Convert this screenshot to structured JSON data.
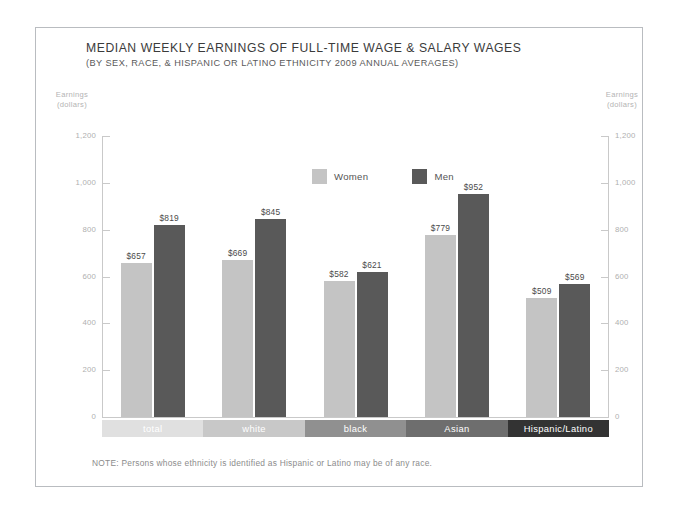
{
  "header": {
    "title": "MEDIAN WEEKLY EARNINGS OF FULL-TIME WAGE & SALARY WAGES",
    "subtitle": "(BY SEX, RACE, & HISPANIC OR LATINO ETHNICITY 2009 ANNUAL AVERAGES)"
  },
  "axis_caption": {
    "line1": "Earnings",
    "line2": "(dollars)"
  },
  "note": "NOTE: Persons whose ethnicity is identified as Hispanic or Latino may be of any race.",
  "colors": {
    "women": "#c4c4c4",
    "men": "#595959",
    "axis": "#c9c9c9",
    "tick_label": "#b0b0b0",
    "frame_border": "#b9bcc0",
    "background": "#ffffff",
    "category_total": "#e0e0e0",
    "category_white": "#c8c8c8",
    "category_black": "#909090",
    "category_asian": "#6e6e6e",
    "category_hispanic": "#333333"
  },
  "chart_data": {
    "type": "bar",
    "title": "MEDIAN WEEKLY EARNINGS OF FULL-TIME WAGE & SALARY WAGES",
    "subtitle": "(BY SEX, RACE, & HISPANIC OR LATINO ETHNICITY 2009 ANNUAL AVERAGES)",
    "xlabel": "",
    "ylabel": "Earnings (dollars)",
    "ylim": [
      0,
      1200
    ],
    "yticks": [
      0,
      200,
      400,
      600,
      800,
      1000,
      1200
    ],
    "ytick_labels": [
      "0",
      "200",
      "400",
      "600",
      "800",
      "1,000",
      "1,200"
    ],
    "grid": false,
    "legend_position": "top-center",
    "categories": [
      "total",
      "white",
      "black",
      "Asian",
      "Hispanic/Latino"
    ],
    "series": [
      {
        "name": "Women",
        "color": "#c4c4c4",
        "values": [
          657,
          669,
          582,
          779,
          509
        ],
        "labels": [
          "$657",
          "$669",
          "$582",
          "$779",
          "$509"
        ]
      },
      {
        "name": "Men",
        "color": "#595959",
        "values": [
          819,
          845,
          621,
          952,
          569
        ],
        "labels": [
          "$819",
          "$845",
          "$621",
          "$952",
          "$569"
        ]
      }
    ],
    "category_band_colors": [
      "#e0e0e0",
      "#c8c8c8",
      "#909090",
      "#6e6e6e",
      "#333333"
    ],
    "note": "NOTE: Persons whose ethnicity is identified as Hispanic or Latino may be of any race."
  }
}
